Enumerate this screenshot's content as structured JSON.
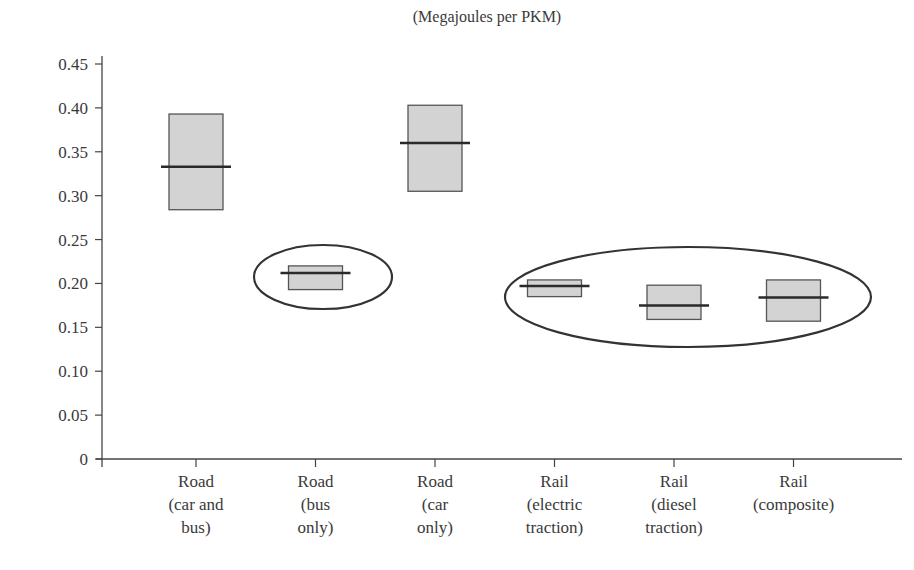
{
  "chart_data": {
    "type": "box",
    "title": "(Megajoules per PKM)",
    "xlabel": "",
    "ylabel": "",
    "ylim": [
      0,
      0.45
    ],
    "yticks": [
      "0",
      "0.05",
      "0.10",
      "0.15",
      "0.20",
      "0.25",
      "0.30",
      "0.35",
      "0.40",
      "0.45"
    ],
    "grid": false,
    "legend": null,
    "categories": [
      [
        "Road",
        "(car and",
        "bus)"
      ],
      [
        "Road",
        "(bus",
        "only)"
      ],
      [
        "Road",
        "(car",
        "only)"
      ],
      [
        "Rail",
        "(electric",
        "traction)"
      ],
      [
        "Rail",
        "(diesel",
        "traction)"
      ],
      [
        "Rail",
        "(composite)"
      ]
    ],
    "series": [
      {
        "name": "Road (car and bus)",
        "low": 0.284,
        "high": 0.393,
        "median": 0.333
      },
      {
        "name": "Road (bus only)",
        "low": 0.193,
        "high": 0.22,
        "median": 0.212
      },
      {
        "name": "Road (car only)",
        "low": 0.305,
        "high": 0.403,
        "median": 0.36
      },
      {
        "name": "Rail (electric traction)",
        "low": 0.185,
        "high": 0.204,
        "median": 0.197
      },
      {
        "name": "Rail (diesel traction)",
        "low": 0.159,
        "high": 0.198,
        "median": 0.175
      },
      {
        "name": "Rail (composite)",
        "low": 0.157,
        "high": 0.204,
        "median": 0.184
      }
    ],
    "annotations": [
      {
        "type": "ellipse",
        "encloses": [
          "Road (bus only)"
        ]
      },
      {
        "type": "ellipse",
        "encloses": [
          "Rail (electric traction)",
          "Rail (diesel traction)",
          "Rail (composite)"
        ]
      }
    ]
  },
  "style": {
    "box_fill": "#d3d3d3",
    "box_stroke": "#555555",
    "median_stroke": "#2a2a2a",
    "axis_color": "#444444",
    "ellipse_color": "#333333"
  }
}
